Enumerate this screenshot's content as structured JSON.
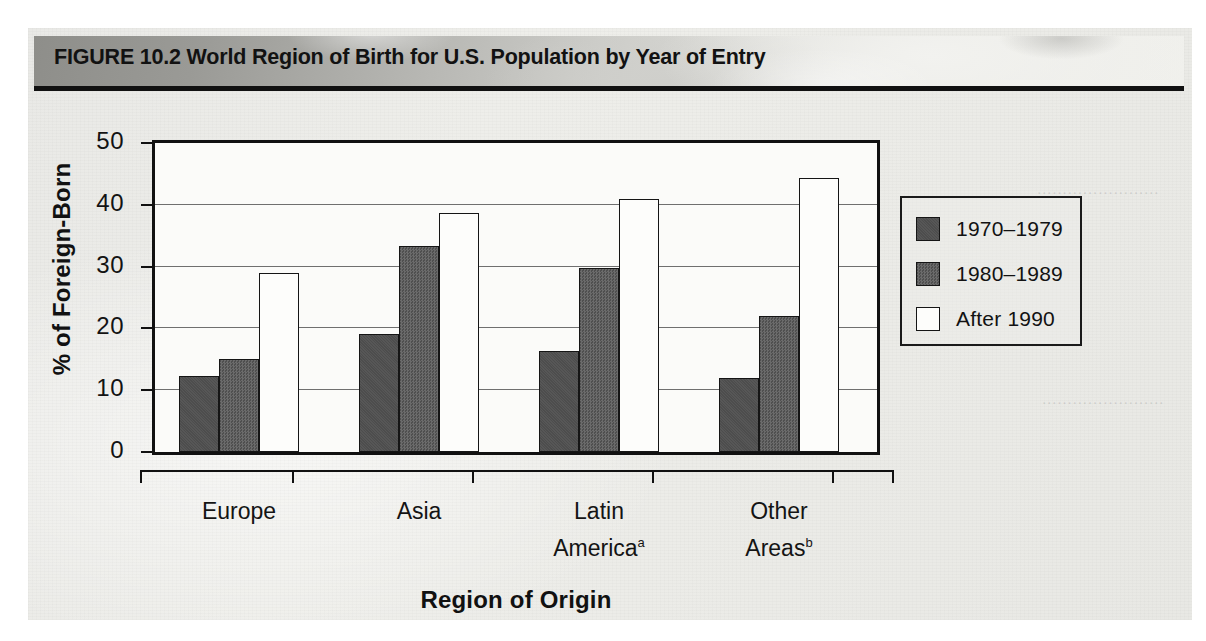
{
  "figure": {
    "title": "FIGURE 10.2 World Region of Birth for U.S. Population by Year of Entry"
  },
  "chart_data": {
    "type": "bar",
    "title": "World Region of Birth for U.S. Population by Year of Entry",
    "xlabel": "Region of Origin",
    "ylabel": "% of Foreign-Born",
    "ylim": [
      0,
      50
    ],
    "yticks": [
      0,
      10,
      20,
      30,
      40,
      50
    ],
    "ytick_labels": [
      "0",
      "10",
      "20",
      "30",
      "40",
      "50"
    ],
    "grid": "horizontal",
    "legend_position": "right",
    "categories": [
      "Europe",
      "Asia",
      "Latin America",
      "Other Areas"
    ],
    "category_labels": [
      {
        "line1": "Europe",
        "line2": "",
        "footnote": ""
      },
      {
        "line1": "Asia",
        "line2": "",
        "footnote": ""
      },
      {
        "line1": "Latin",
        "line2": "America",
        "footnote": "a"
      },
      {
        "line1": "Other",
        "line2": "Areas",
        "footnote": "b"
      }
    ],
    "series": [
      {
        "name": "1970–1979",
        "color": "#4d4d4d",
        "values": [
          12.3,
          19.1,
          16.3,
          12.0
        ]
      },
      {
        "name": "1980–1989",
        "color": "#5c5c5c",
        "values": [
          15.0,
          33.3,
          29.8,
          22.0
        ]
      },
      {
        "name": "After 1990",
        "color": "#fdfdfb",
        "values": [
          29.0,
          38.7,
          40.9,
          44.3
        ]
      }
    ]
  },
  "legend": {
    "entries": [
      {
        "label": "1970–1979",
        "swatch": "dark-gray-swatch"
      },
      {
        "label": "1980–1989",
        "swatch": "medium-gray-swatch"
      },
      {
        "label": "After 1990",
        "swatch": "white-swatch"
      }
    ]
  },
  "ghost_text": {
    "lines": [
      "reverse page bleed through",
      "of the printed textbook sheet",
      "faint mirrored body copy",
      "not legible in the scan"
    ]
  }
}
